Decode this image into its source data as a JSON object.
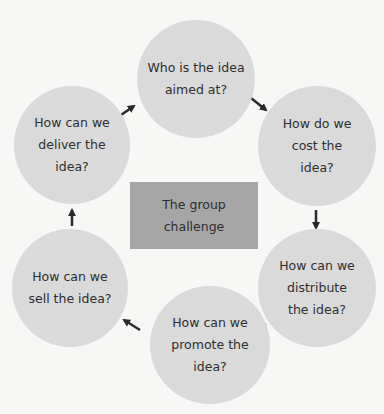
{
  "diagram": {
    "center": {
      "label": "The group\nchallenge",
      "color": "#a6a6a6"
    },
    "nodes": [
      {
        "id": "aimed",
        "label": "Who is the idea\naimed at?"
      },
      {
        "id": "cost",
        "label": "How do we\ncost the\nidea?"
      },
      {
        "id": "distribute",
        "label": "How can we\ndistribute\nthe idea?"
      },
      {
        "id": "promote",
        "label": "How can we\npromote the\nidea?"
      },
      {
        "id": "sell",
        "label": "How can we\nsell the idea?"
      },
      {
        "id": "deliver",
        "label": "How can we\ndeliver the\nidea?"
      }
    ],
    "node_color": "#dadada",
    "arrow_color": "#2a2a2a",
    "edges": [
      [
        "aimed",
        "cost"
      ],
      [
        "cost",
        "distribute"
      ],
      [
        "distribute",
        "promote"
      ],
      [
        "promote",
        "sell"
      ],
      [
        "sell",
        "deliver"
      ],
      [
        "deliver",
        "aimed"
      ]
    ]
  }
}
